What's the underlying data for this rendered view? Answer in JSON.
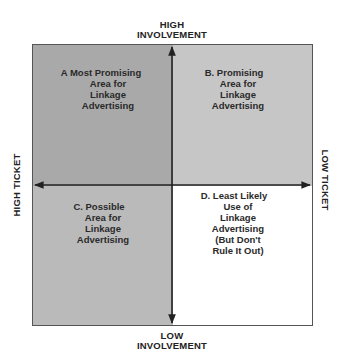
{
  "diagram": {
    "type": "quadrant-matrix",
    "axes": {
      "top": [
        "HIGH",
        "INVOLVEMENT"
      ],
      "bottom": [
        "LOW",
        "INVOLVEMENT"
      ],
      "left": "HIGH TICKET",
      "right": "LOW TICKET"
    },
    "quadrants": {
      "a": {
        "lines": [
          "A  Most Promising",
          "Area for",
          "Linkage",
          "Advertising"
        ],
        "fill": "#a9a9a9"
      },
      "b": {
        "lines": [
          "B. Promising",
          "Area for",
          "Linkage",
          "Advertising"
        ],
        "fill": "#c6c6c6"
      },
      "c": {
        "lines": [
          "C. Possible",
          "Area for",
          "Linkage",
          "Advertising"
        ],
        "fill": "#bababa"
      },
      "d": {
        "lines": [
          "D.  Least Likely",
          "Use of",
          "Linkage",
          "Advertising",
          "(But Don't",
          "Rule It Out)"
        ],
        "fill": "#ffffff"
      }
    }
  }
}
